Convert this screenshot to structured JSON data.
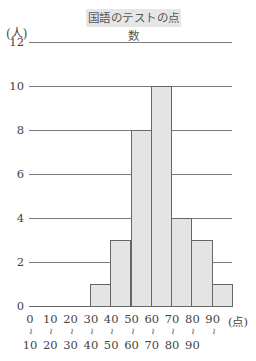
{
  "title": "国語のテストの点数",
  "y_unit": "(人)",
  "x_unit": "(点)",
  "range_separator": "~",
  "y_ticks": [
    "12",
    "10",
    "8",
    "6",
    "4",
    "2",
    "0"
  ],
  "x_lower": [
    "0",
    "10",
    "20",
    "30",
    "40",
    "50",
    "60",
    "70",
    "80",
    "90"
  ],
  "x_upper": [
    "10",
    "20",
    "30",
    "40",
    "50",
    "60",
    "70",
    "80",
    "90",
    ""
  ],
  "chart_data": {
    "type": "bar",
    "title": "国語のテストの点数",
    "xlabel": "(点)",
    "ylabel": "(人)",
    "categories": [
      "0~10",
      "10~20",
      "20~30",
      "30~40",
      "40~50",
      "50~60",
      "60~70",
      "70~80",
      "80~90",
      "90~"
    ],
    "values": [
      0,
      0,
      0,
      1,
      3,
      8,
      10,
      4,
      3,
      1
    ],
    "ylim": [
      0,
      12
    ],
    "yticks": [
      0,
      2,
      4,
      6,
      8,
      10,
      12
    ],
    "grid": true,
    "legend": "none",
    "histogram": true
  }
}
